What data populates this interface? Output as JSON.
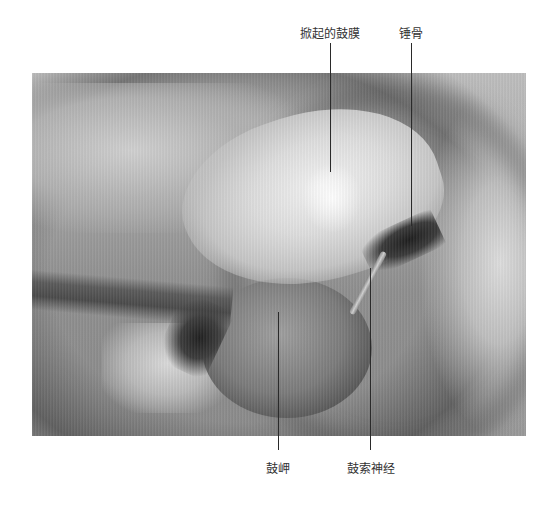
{
  "figure": {
    "type": "annotated surgical photograph (grayscale)",
    "labels": [
      {
        "id": "raised-tympanic-membrane",
        "text": "掀起的鼓膜",
        "position": "top"
      },
      {
        "id": "malleus",
        "text": "锤骨",
        "position": "top"
      },
      {
        "id": "promontory",
        "text": "鼓岬",
        "position": "bottom"
      },
      {
        "id": "chorda-tympani",
        "text": "鼓索神经",
        "position": "bottom"
      }
    ]
  },
  "colors": {
    "background": "#ffffff",
    "label_text": "#333333",
    "leader_line": "#2a2a2a"
  }
}
